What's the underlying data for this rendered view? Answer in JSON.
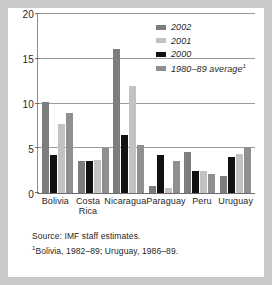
{
  "chart_data": {
    "type": "bar",
    "title": "",
    "xlabel": "",
    "ylabel": "",
    "ylim": [
      0,
      20
    ],
    "yticks": [
      0,
      5,
      10,
      15,
      20
    ],
    "grid": true,
    "legend_position": "top-right",
    "categories": [
      "Bolivia",
      "Costa Rica",
      "Nicaragua",
      "Paraguay",
      "Peru",
      "Uruguay"
    ],
    "series": [
      {
        "name": "2002",
        "color": "#7d7d7d",
        "values": [
          10.2,
          3.6,
          16.1,
          0.8,
          4.6,
          1.9
        ]
      },
      {
        "name": "2001",
        "color": "#c2c2c2",
        "values": [
          7.7,
          3.7,
          12.0,
          0.6,
          2.5,
          4.4
        ]
      },
      {
        "name": "2000",
        "color": "#111111",
        "values": [
          4.2,
          3.6,
          6.5,
          4.2,
          2.5,
          4.0
        ]
      },
      {
        "name": "1980–89 average¹",
        "color": "#8f8f8f",
        "values": [
          8.9,
          5.0,
          5.4,
          3.6,
          2.1,
          5.1
        ]
      }
    ],
    "bar_order": [
      "2002",
      "2000",
      "2001",
      "1980–89 average¹"
    ]
  },
  "legend": {
    "items": [
      {
        "label": "2002"
      },
      {
        "label": "2001"
      },
      {
        "label": "2000"
      },
      {
        "label": "1980–89 average",
        "footnote_marker": "1"
      }
    ]
  },
  "notes": {
    "source": "Source: IMF staff estimates.",
    "footnote_marker": "1",
    "footnote": "Bolivia, 1982–89; Uruguay, 1986–89."
  }
}
